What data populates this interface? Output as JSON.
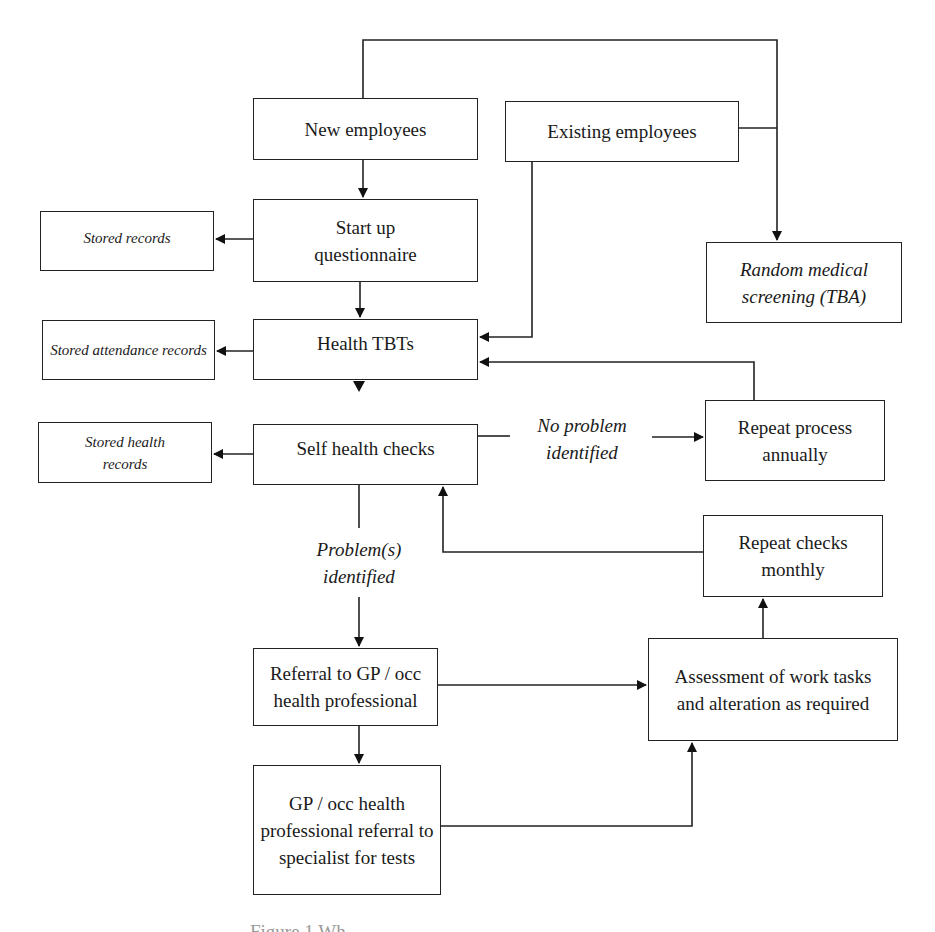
{
  "diagram": {
    "type": "flowchart",
    "nodes": {
      "new_employees": "New employees",
      "existing_employees": "Existing employees",
      "startup_questionnaire": "Start up questionnaire",
      "random_medical_screening": "Random medical screening (TBA)",
      "stored_records": "Stored records",
      "health_tbts": "Health TBTs",
      "stored_attendance_records": "Stored attendance records",
      "self_health_checks": "Self health checks",
      "stored_health_records": "Stored health records",
      "repeat_process_annually": "Repeat process annually",
      "repeat_checks_monthly": "Repeat checks monthly",
      "referral_gp": "Referral to GP / occ health professional",
      "assessment_work_tasks": "Assessment of work tasks and alteration as required",
      "specialist_referral": "GP / occ health professional referral to specialist for tests"
    },
    "edge_labels": {
      "no_problem": "No problem identified",
      "problems": "Problem(s) identified"
    },
    "edges": [
      {
        "from": "New employees",
        "to": "Start up questionnaire"
      },
      {
        "from": "New employees",
        "to": "Random medical screening (TBA)"
      },
      {
        "from": "Existing employees",
        "to": "Random medical screening (TBA)"
      },
      {
        "from": "Existing employees",
        "to": "Health TBTs"
      },
      {
        "from": "Start up questionnaire",
        "to": "Stored records"
      },
      {
        "from": "Start up questionnaire",
        "to": "Health TBTs"
      },
      {
        "from": "Health TBTs",
        "to": "Stored attendance records"
      },
      {
        "from": "Health TBTs",
        "to": "Self health checks"
      },
      {
        "from": "Self health checks",
        "to": "Stored health records"
      },
      {
        "from": "Self health checks",
        "to": "Repeat process annually",
        "label": "No problem identified"
      },
      {
        "from": "Repeat process annually",
        "to": "Health TBTs"
      },
      {
        "from": "Self health checks",
        "to": "Referral to GP / occ health professional",
        "label": "Problem(s) identified"
      },
      {
        "from": "Referral to GP / occ health professional",
        "to": "Assessment of work tasks and alteration as required"
      },
      {
        "from": "Referral to GP / occ health professional",
        "to": "GP / occ health professional referral to specialist for tests"
      },
      {
        "from": "GP / occ health professional referral to specialist for tests",
        "to": "Assessment of work tasks and alteration as required"
      },
      {
        "from": "Assessment of work tasks and alteration as required",
        "to": "Repeat checks monthly"
      },
      {
        "from": "Repeat checks monthly",
        "to": "Self health checks"
      }
    ]
  },
  "caption": "Figure 1 Wh"
}
